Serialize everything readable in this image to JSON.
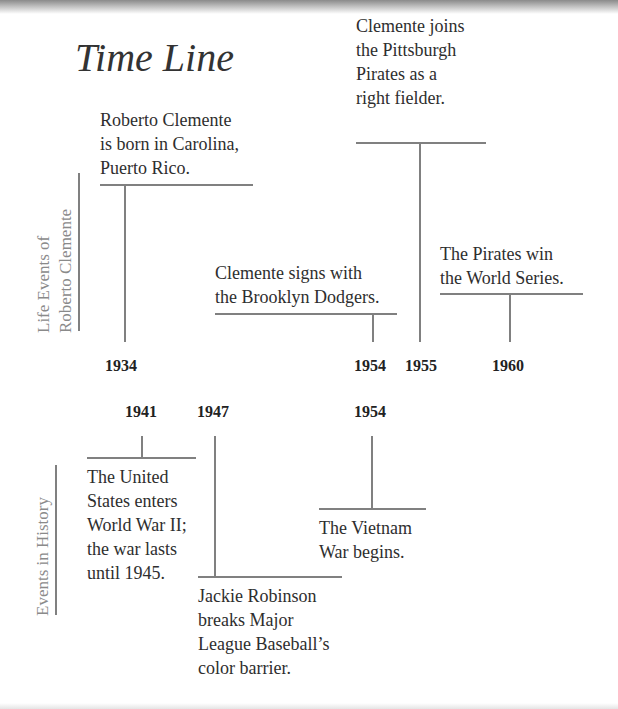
{
  "title": "Time Line",
  "side_labels": {
    "life": "Life Events of\nRoberto Clemente",
    "history": "Events in History"
  },
  "life_events": [
    {
      "year": "1934",
      "text": "Roberto Clemente\nis born in Carolina,\nPuerto Rico."
    },
    {
      "year": "1954",
      "text": "Clemente signs with\nthe Brooklyn Dodgers."
    },
    {
      "year": "1955",
      "text": "Clemente joins\nthe Pittsburgh\nPirates as a\nright fielder."
    },
    {
      "year": "1960",
      "text": "The Pirates win\nthe World Series."
    }
  ],
  "history_events": [
    {
      "year": "1941",
      "text": "The United\nStates enters\nWorld War II;\nthe war lasts\nuntil 1945."
    },
    {
      "year": "1947",
      "text": "Jackie Robinson\nbreaks Major\nLeague Baseball’s\ncolor barrier."
    },
    {
      "year": "1954",
      "text": "The Vietnam\nWar begins."
    }
  ],
  "colors": {
    "line": "#808080",
    "side_label": "#8a8a8a",
    "text": "#2e2e2e"
  }
}
